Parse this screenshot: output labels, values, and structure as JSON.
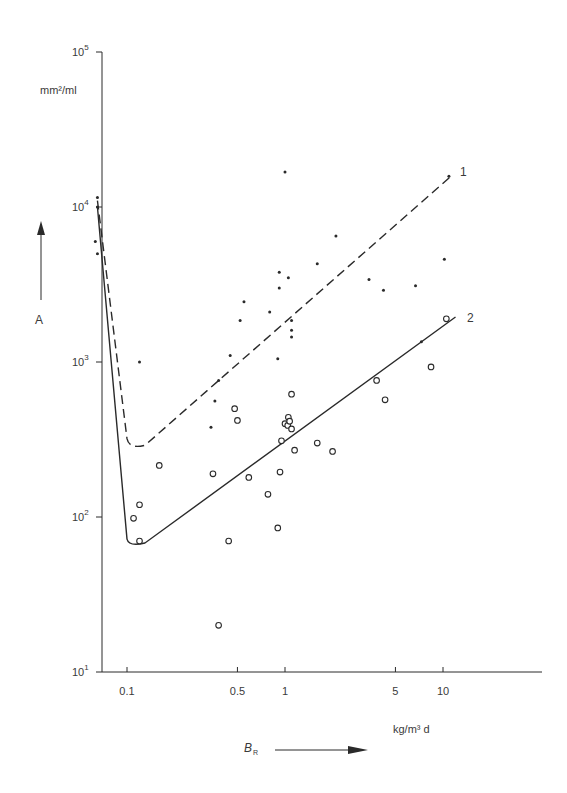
{
  "chart_data": {
    "type": "scatter",
    "title": "",
    "xlabel": "B_R",
    "xlabel_unit": "kg/m³ d",
    "ylabel": "A",
    "ylabel_unit": "mm²/ml",
    "x_scale": "log",
    "y_scale": "log",
    "xlim": [
      0.06,
      45
    ],
    "ylim": [
      10,
      100000
    ],
    "x_ticks": [
      {
        "value": 0.1,
        "label": "0.1"
      },
      {
        "value": 0.5,
        "label": "0.5"
      },
      {
        "value": 1,
        "label": "1"
      },
      {
        "value": 5,
        "label": "5"
      },
      {
        "value": 10,
        "label": "10"
      }
    ],
    "y_ticks": [
      {
        "value": 10,
        "label": "10",
        "exp": "1"
      },
      {
        "value": 100,
        "label": "10",
        "exp": "2"
      },
      {
        "value": 1000,
        "label": "10",
        "exp": "3"
      },
      {
        "value": 10000,
        "label": "10",
        "exp": "4"
      },
      {
        "value": 100000,
        "label": "10",
        "exp": "5"
      }
    ],
    "grid": false,
    "series": [
      {
        "name": "1",
        "marker": "dot",
        "points": [
          [
            0.065,
            11500
          ],
          [
            0.065,
            10000
          ],
          [
            0.063,
            6000
          ],
          [
            0.065,
            5000
          ],
          [
            0.12,
            1000
          ],
          [
            0.34,
            380
          ],
          [
            0.36,
            560
          ],
          [
            0.38,
            760
          ],
          [
            0.45,
            1100
          ],
          [
            0.52,
            1850
          ],
          [
            0.55,
            2450
          ],
          [
            0.8,
            2100
          ],
          [
            0.9,
            1050
          ],
          [
            0.92,
            3000
          ],
          [
            0.92,
            3800
          ],
          [
            1.0,
            16800
          ],
          [
            1.05,
            3500
          ],
          [
            1.1,
            1850
          ],
          [
            1.1,
            1600
          ],
          [
            1.1,
            1450
          ],
          [
            1.6,
            4300
          ],
          [
            2.1,
            6500
          ],
          [
            3.4,
            3400
          ],
          [
            4.2,
            2900
          ],
          [
            6.7,
            3100
          ],
          [
            10.2,
            4600
          ],
          [
            10.9,
            15800
          ],
          [
            7.3,
            1350
          ]
        ]
      },
      {
        "name": "2",
        "marker": "circle",
        "points": [
          [
            0.12,
            120
          ],
          [
            0.11,
            98
          ],
          [
            0.12,
            70
          ],
          [
            0.16,
            215
          ],
          [
            0.35,
            190
          ],
          [
            0.44,
            70
          ],
          [
            0.48,
            500
          ],
          [
            0.5,
            420
          ],
          [
            0.38,
            20
          ],
          [
            0.59,
            180
          ],
          [
            0.78,
            140
          ],
          [
            0.9,
            85
          ],
          [
            0.93,
            195
          ],
          [
            0.95,
            310
          ],
          [
            1.0,
            400
          ],
          [
            1.04,
            390
          ],
          [
            1.05,
            440
          ],
          [
            1.07,
            415
          ],
          [
            1.1,
            370
          ],
          [
            1.15,
            270
          ],
          [
            1.1,
            620
          ],
          [
            1.6,
            300
          ],
          [
            2.0,
            265
          ],
          [
            3.8,
            760
          ],
          [
            4.3,
            570
          ],
          [
            8.4,
            930
          ],
          [
            10.5,
            1900
          ]
        ]
      }
    ],
    "fit_lines": [
      {
        "name": "1",
        "style": "dashed",
        "path": [
          [
            0.065,
            11000
          ],
          [
            0.1,
            320
          ],
          [
            0.13,
            290
          ],
          [
            11,
            15500
          ]
        ]
      },
      {
        "name": "2",
        "style": "solid",
        "path": [
          [
            0.065,
            10000
          ],
          [
            0.1,
            72
          ],
          [
            0.13,
            68
          ],
          [
            12,
            1950
          ]
        ]
      }
    ],
    "annotations": [
      {
        "text": "1",
        "near": [
          12.5,
          17000
        ]
      },
      {
        "text": "2",
        "near": [
          13.5,
          2000
        ]
      }
    ]
  },
  "labels": {
    "y_unit": "mm²/ml",
    "y_name": "A",
    "x_unit": "kg/m³ d",
    "x_name": "B",
    "x_name_sub": "R",
    "line1": "1",
    "line2": "2"
  }
}
